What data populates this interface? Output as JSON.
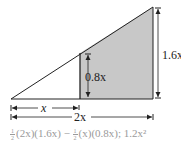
{
  "diagram": {
    "title": "",
    "colors": {
      "line": "#222222",
      "shade": "#c8c8c8",
      "formula_text": "#9a9a9a"
    },
    "labels": {
      "small_height": "0.8x",
      "large_height": "1.6x",
      "small_base": "x",
      "large_base": "2x"
    },
    "shapes": {
      "large_triangle": {
        "base": "2x",
        "height": "1.6x"
      },
      "small_triangle": {
        "base": "x",
        "height": "0.8x",
        "shaded": false
      },
      "shaded_region": {
        "description": "trapezoid between inner vertical and outer vertical",
        "shaded": true
      }
    },
    "formula": {
      "frac1": {
        "num": "1",
        "den": "2"
      },
      "part1": "(2x)(1.6x) − ",
      "frac2": {
        "num": "1",
        "den": "2"
      },
      "part2": "(x)(0.8x); 1.2x²",
      "full_text": "1/2(2x)(1.6x) − 1/2(x)(0.8x); 1.2x²"
    }
  }
}
